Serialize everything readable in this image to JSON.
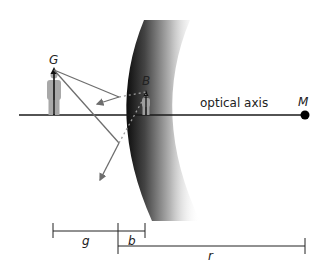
{
  "diagram": {
    "type": "convex-mirror-ray-diagram",
    "labels": {
      "object": "G",
      "image": "B",
      "axis": "optical axis",
      "center": "M",
      "object_distance": "g",
      "image_distance": "b",
      "radius": "r"
    },
    "colors": {
      "axis": "#1a1a1a",
      "ray": "#6e6e6e",
      "figure_gray": "#a8a8a8",
      "mirror_dark": "#111111",
      "background": "#ffffff"
    }
  }
}
